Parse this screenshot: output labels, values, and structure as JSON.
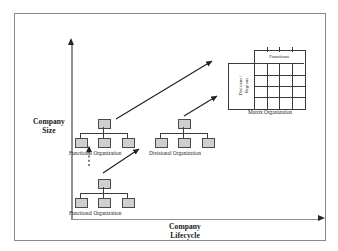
{
  "diagram": {
    "axes": {
      "y_label": "Company\nSize",
      "y_label_line1": "Company",
      "y_label_line2": "Size",
      "x_label_line1": "Company",
      "x_label_line2": "Lifecycle"
    },
    "nodes": [
      {
        "id": "functional-small",
        "label": "Functional Organization",
        "type": "org-chart",
        "children_count": 3,
        "position": "bottom-left"
      },
      {
        "id": "functional-large",
        "label": "Functional Organization",
        "type": "org-chart",
        "children_count": 3,
        "position": "middle-left"
      },
      {
        "id": "divisional",
        "label": "Divisional Organization",
        "type": "org-chart",
        "children_count": 3,
        "position": "middle-center"
      },
      {
        "id": "matrix",
        "label": "Matrix Organization",
        "type": "matrix",
        "column_header": "Functions",
        "row_header_line1": "Divisions /",
        "row_header_line2": "Regions",
        "grid_columns": 4,
        "grid_rows": 4,
        "position": "top-right"
      }
    ],
    "connectors": [
      {
        "from": "functional-small",
        "to": "functional-large",
        "style": "dotted-arrow"
      },
      {
        "from": "functional-small",
        "to": "divisional",
        "style": "solid-arrow"
      },
      {
        "from": "functional-large",
        "to": "matrix",
        "style": "solid-arrow"
      },
      {
        "from": "divisional",
        "to": "matrix",
        "style": "solid-arrow"
      }
    ],
    "colors": {
      "box_fill": "#cfcfcf",
      "box_stroke": "#4a4a4a",
      "axis": "#8f8f8f",
      "arrow": "#262626",
      "frame": "#8a8a8a",
      "text": "#16181c"
    }
  }
}
